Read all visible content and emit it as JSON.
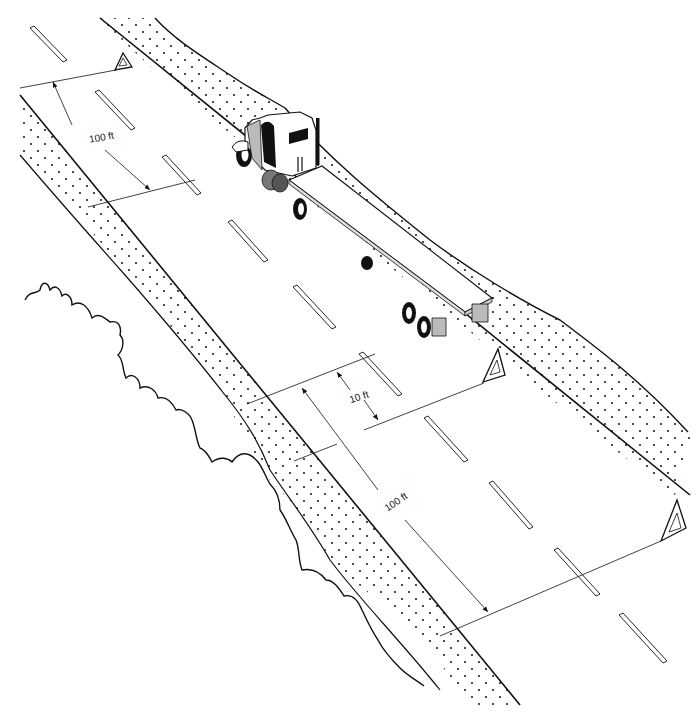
{
  "diagram": {
    "type": "warning-triangle-placement",
    "colors": {
      "background": "#ffffff",
      "line": "#111111",
      "shade": "#b8b8b8",
      "dark": "#1a1a1a"
    },
    "labels": {
      "rear_distance_far": "100 ft",
      "rear_distance_near": "10 ft",
      "front_distance": "100 ft"
    },
    "elements": {
      "vehicle": "tractor-trailer (flatbed)",
      "triangles": [
        "front-triangle",
        "near-rear-triangle",
        "far-rear-triangle"
      ]
    }
  }
}
